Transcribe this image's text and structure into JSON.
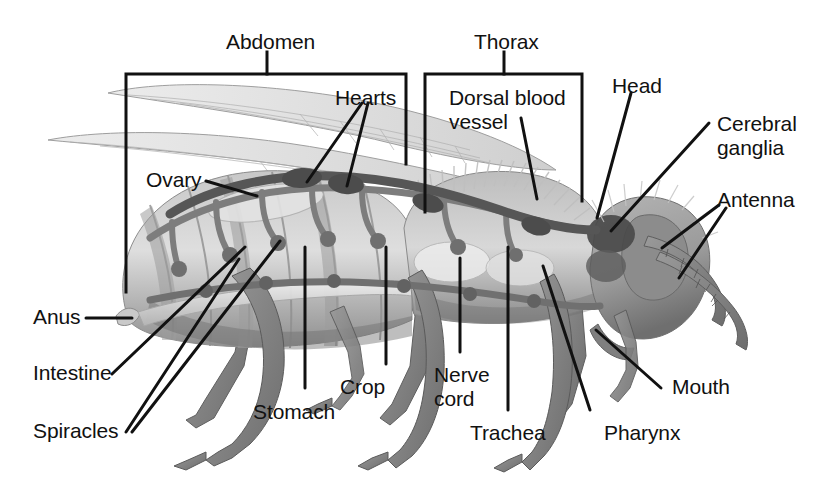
{
  "figure": {
    "style": "grayscale scanned textbook illustration",
    "background_color": "#ffffff",
    "line_color": "#111111",
    "width": 827,
    "height": 490
  },
  "brackets": [
    {
      "id": "abdomen",
      "label": "Abdomen",
      "label_x": 226,
      "label_y": 30,
      "left": 126,
      "right": 406,
      "top": 74,
      "left_bottom": 292,
      "right_bottom": 164,
      "stem_x": 267,
      "stem_top": 52,
      "stem_bottom": 74
    },
    {
      "id": "thorax",
      "label": "Thorax",
      "label_x": 474,
      "label_y": 30,
      "left": 425,
      "right": 582,
      "top": 74,
      "left_bottom": 212,
      "right_bottom": 201,
      "stem_x": 504,
      "stem_top": 52,
      "stem_bottom": 74
    }
  ],
  "labels": [
    {
      "id": "hearts",
      "text": "Hearts",
      "x": 335,
      "y": 86,
      "align": "left",
      "lines": [
        "Hearts"
      ]
    },
    {
      "id": "dorsal-blood-vessel",
      "text": "Dorsal blood vessel",
      "x": 449,
      "y": 86,
      "align": "left",
      "lines": [
        "Dorsal blood",
        "vessel"
      ]
    },
    {
      "id": "head",
      "text": "Head",
      "x": 612,
      "y": 74,
      "align": "left",
      "lines": [
        "Head"
      ]
    },
    {
      "id": "cerebral-ganglia",
      "text": "Cerebral ganglia",
      "x": 717,
      "y": 112,
      "align": "left",
      "lines": [
        "Cerebral",
        "ganglia"
      ]
    },
    {
      "id": "antenna",
      "text": "Antenna",
      "x": 717,
      "y": 188,
      "align": "left",
      "lines": [
        "Antenna"
      ]
    },
    {
      "id": "ovary",
      "text": "Ovary",
      "x": 146,
      "y": 168,
      "align": "left",
      "lines": [
        "Ovary"
      ]
    },
    {
      "id": "anus",
      "text": "Anus",
      "x": 33,
      "y": 305,
      "align": "left",
      "lines": [
        "Anus"
      ]
    },
    {
      "id": "intestine",
      "text": "Intestine",
      "x": 33,
      "y": 361,
      "align": "left",
      "lines": [
        "Intestine"
      ]
    },
    {
      "id": "spiracles",
      "text": "Spiracles",
      "x": 33,
      "y": 419,
      "align": "left",
      "lines": [
        "Spiracles"
      ]
    },
    {
      "id": "stomach",
      "text": "Stomach",
      "x": 253,
      "y": 400,
      "align": "left",
      "lines": [
        "Stomach"
      ]
    },
    {
      "id": "crop",
      "text": "Crop",
      "x": 340,
      "y": 375,
      "align": "left",
      "lines": [
        "Crop"
      ]
    },
    {
      "id": "nerve-cord",
      "text": "Nerve cord",
      "x": 434,
      "y": 363,
      "align": "left",
      "lines": [
        "Nerve",
        "cord"
      ]
    },
    {
      "id": "trachea",
      "text": "Trachea",
      "x": 470,
      "y": 421,
      "align": "left",
      "lines": [
        "Trachea"
      ]
    },
    {
      "id": "pharynx",
      "text": "Pharynx",
      "x": 604,
      "y": 421,
      "align": "left",
      "lines": [
        "Pharynx"
      ]
    },
    {
      "id": "mouth",
      "text": "Mouth",
      "x": 672,
      "y": 375,
      "align": "left",
      "lines": [
        "Mouth"
      ]
    }
  ],
  "leaders": [
    {
      "id": "hearts-left",
      "for": "hearts",
      "points": "362,103 307,182"
    },
    {
      "id": "hearts-right",
      "for": "hearts",
      "points": "368,103 347,186"
    },
    {
      "id": "dorsal-blood-vessel-leader",
      "for": "dorsal-blood-vessel",
      "points": "521,118 537,199"
    },
    {
      "id": "head-leader",
      "for": "head",
      "points": "631,93 597,218"
    },
    {
      "id": "cerebral-ganglia-leader",
      "for": "cerebral-ganglia",
      "points": "709,123 611,231"
    },
    {
      "id": "antenna-upper",
      "for": "antenna",
      "points": "719,205 662,248"
    },
    {
      "id": "antenna-lower",
      "for": "antenna",
      "points": "726,208 679,278"
    },
    {
      "id": "ovary-leader",
      "for": "ovary",
      "points": "206,181 257,196"
    },
    {
      "id": "anus-leader",
      "for": "anus",
      "points": "86,318 132,318"
    },
    {
      "id": "intestine-leader",
      "for": "intestine",
      "points": "112,374 245,247"
    },
    {
      "id": "spiracles-a",
      "for": "spiracles",
      "points": "126,432 239,259"
    },
    {
      "id": "spiracles-b",
      "for": "spiracles",
      "points": "132,432 280,241"
    },
    {
      "id": "stomach-leader",
      "for": "stomach",
      "points": "305,388 305,247"
    },
    {
      "id": "crop-leader",
      "for": "crop",
      "points": "386,364 386,247"
    },
    {
      "id": "nerve-cord-leader",
      "for": "nerve-cord",
      "points": "460,352 460,258"
    },
    {
      "id": "trachea-leader",
      "for": "trachea",
      "points": "508,410 508,247"
    },
    {
      "id": "pharynx-leader",
      "for": "pharynx",
      "points": "590,410 543,266"
    },
    {
      "id": "mouth-leader",
      "for": "mouth",
      "points": "661,388 596,330"
    }
  ],
  "anatomy": {
    "parts": [
      "abdomen",
      "thorax",
      "head",
      "wings",
      "legs",
      "antennae",
      "dorsal blood vessel",
      "hearts",
      "ovary",
      "intestine",
      "anus",
      "spiracles",
      "trachea",
      "crop",
      "stomach",
      "nerve cord",
      "cerebral ganglia",
      "pharynx",
      "mouth"
    ],
    "wing_count": 2,
    "leg_count": 6,
    "antenna_count": 2,
    "heart_chamber_count": 2,
    "spiracle_count": 7
  },
  "colors": {
    "line": "#111111",
    "body_light": "#d6d6d6",
    "body_mid": "#a9a9a9",
    "body_dark": "#7d7d7d",
    "body_darkest": "#4f4f4f",
    "tube": "#8a8a8a",
    "tube_dark": "#5e5e5e",
    "wing": "#c9c9c9"
  }
}
